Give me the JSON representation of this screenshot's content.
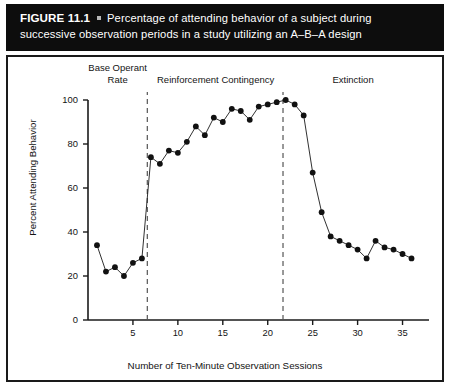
{
  "figure": {
    "number_label": "FIGURE 11.1",
    "bullet_icon": "bullet-separator",
    "caption_line1": "Percentage of attending behavior of a subject during",
    "caption_line2": "successive observation periods in a study utilizing an A–B–A design",
    "banner_color": "#0d0d0d",
    "banner_text_color": "#ffffff"
  },
  "chart_data": {
    "type": "line",
    "title": "",
    "xlabel": "Number of Ten-Minute Observation Sessions",
    "ylabel": "Percent Attending Behavior",
    "xlim": [
      0,
      37.5
    ],
    "ylim": [
      0,
      100
    ],
    "xticks": [
      5,
      10,
      15,
      20,
      25,
      30,
      35
    ],
    "xtick_labels": [
      "5",
      "10",
      "15",
      "20",
      "25",
      "30",
      "35"
    ],
    "yticks": [
      0,
      20,
      40,
      60,
      80,
      100
    ],
    "ytick_labels": [
      "0",
      "20",
      "40",
      "60",
      "80",
      "100"
    ],
    "grid": false,
    "legend": "none",
    "marker": "filled-circle",
    "line_color": "#1a1a1a",
    "marker_color": "#111111",
    "x": [
      1,
      2,
      3,
      4,
      5,
      6,
      7,
      8,
      9,
      10,
      11,
      12,
      13,
      14,
      15,
      16,
      17,
      18,
      19,
      20,
      21,
      22,
      23,
      24,
      25,
      26,
      27,
      28,
      29,
      30,
      31,
      32,
      33,
      34,
      35,
      36
    ],
    "values": [
      34,
      22,
      24,
      20,
      26,
      28,
      74,
      71,
      77,
      76,
      81,
      88,
      84,
      92,
      90,
      96,
      95,
      91,
      97,
      98,
      99,
      100,
      98,
      93,
      67,
      49,
      38,
      36,
      34,
      32,
      28,
      36,
      33,
      32,
      30,
      28
    ],
    "annotations": [
      {
        "name": "phase-divider-1",
        "type": "vline",
        "x": 6.6,
        "style": "dashed"
      },
      {
        "name": "phase-divider-2",
        "type": "vline",
        "x": 21.7,
        "style": "dashed"
      }
    ],
    "phases": [
      {
        "name": "baseline",
        "label_line1": "Base Operant",
        "label_line2": "Rate",
        "x_center": 3.3
      },
      {
        "name": "reinforcement",
        "label_line1": "Reinforcement Contingency",
        "label_line2": "",
        "x_center": 14.2
      },
      {
        "name": "extinction",
        "label_line1": "Extinction",
        "label_line2": "",
        "x_center": 29.5
      }
    ]
  }
}
